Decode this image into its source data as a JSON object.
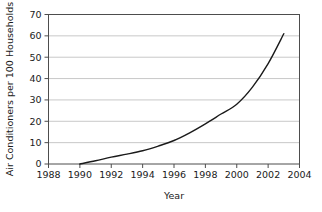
{
  "chart_data": {
    "type": "line",
    "title": "",
    "xlabel": "Year",
    "ylabel": "Air Conditioners per 100 Households",
    "xlim": [
      1988,
      2004
    ],
    "ylim": [
      0,
      70
    ],
    "xticks": [
      1988,
      1990,
      1992,
      1994,
      1996,
      1998,
      2000,
      2002,
      2004
    ],
    "yticks": [
      0,
      10,
      20,
      30,
      40,
      50,
      60,
      70
    ],
    "xtick_labels": [
      "1988",
      "1990",
      "1992",
      "1994",
      "1996",
      "1998",
      "2000",
      "2002",
      "2004"
    ],
    "ytick_labels": [
      "0",
      "10",
      "20",
      "30",
      "40",
      "50",
      "60",
      "70"
    ],
    "grid": "horizontal",
    "legend": "none",
    "series": [
      {
        "name": "Air Conditioners per 100 Households",
        "color": "#1a1a1a",
        "x": [
          1990,
          1991,
          1992,
          1993,
          1994,
          1995,
          1996,
          1997,
          1998,
          1999,
          2000,
          2001,
          2002,
          2003
        ],
        "values": [
          0,
          1.5,
          3.2,
          4.6,
          6.2,
          8.4,
          11.0,
          14.6,
          18.8,
          23.4,
          28.0,
          36.0,
          47.0,
          61.0
        ]
      }
    ]
  },
  "axes": {
    "x_title": "Year",
    "y_title": "Air Conditioners per 100 Households"
  },
  "style": {
    "frame_color": "#4d4d4d",
    "grid_color": "#c8c8c8",
    "line_color": "#1a1a1a",
    "background": "#ffffff"
  }
}
